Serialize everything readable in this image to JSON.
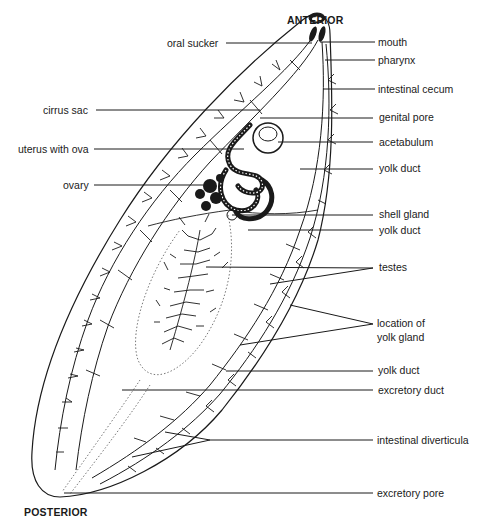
{
  "diagram": {
    "orientation": {
      "top": "ANTERIOR",
      "bottom": "POSTERIOR"
    },
    "labels_left": [
      {
        "id": "oral-sucker",
        "text": "oral sucker"
      },
      {
        "id": "cirrus-sac",
        "text": "cirrus sac"
      },
      {
        "id": "uterus-with-ova",
        "text": "uterus with ova"
      },
      {
        "id": "ovary",
        "text": "ovary"
      }
    ],
    "labels_right": [
      {
        "id": "mouth",
        "text": "mouth"
      },
      {
        "id": "pharynx",
        "text": "pharynx"
      },
      {
        "id": "intestinal-cecum",
        "text": "intestinal cecum"
      },
      {
        "id": "genital-pore",
        "text": "genital pore"
      },
      {
        "id": "acetabulum",
        "text": "acetabulum"
      },
      {
        "id": "yolk-duct-1",
        "text": "yolk duct"
      },
      {
        "id": "shell-gland",
        "text": "shell gland"
      },
      {
        "id": "yolk-duct-2",
        "text": "yolk duct"
      },
      {
        "id": "testes",
        "text": "testes"
      },
      {
        "id": "location-of-yolk-gland",
        "text": "location of\nyolk gland",
        "line1": "location of",
        "line2": "yolk gland"
      },
      {
        "id": "yolk-duct-3",
        "text": "yolk duct"
      },
      {
        "id": "excretory-duct",
        "text": "excretory duct"
      },
      {
        "id": "intestinal-diverticula",
        "text": "intestinal diverticula"
      },
      {
        "id": "excretory-pore",
        "text": "excretory pore"
      }
    ]
  }
}
